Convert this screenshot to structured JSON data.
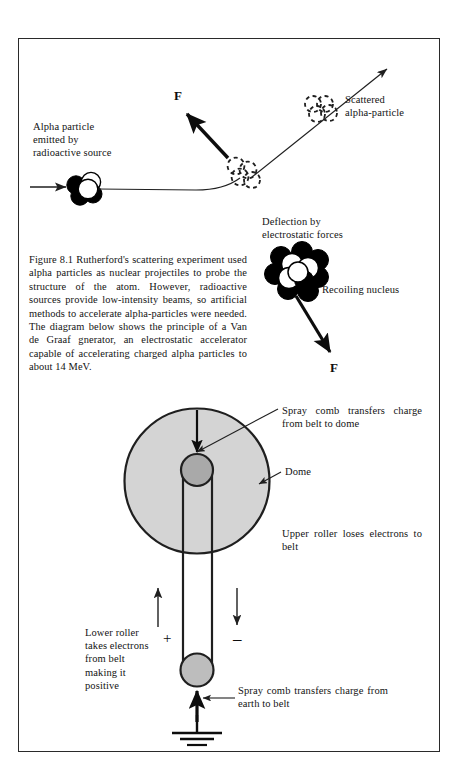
{
  "figure": {
    "caption": "Figure 8.1 Rutherford's scattering experiment used alpha particles as nuclear projectiles to probe the structure of the atom. However, radioactive sources provide low-intensity beams, so artificial methods to accelerate alpha-particles were needed. The diagram below shows the principle of a Van de Graaf gnerator, an electrostatic accelerator capable of accelerating charged alpha particles to about 14 MeV.",
    "labels": {
      "alpha_particle": "Alpha particle\nemitted by\nradioactive source",
      "scattered": "Scattered\nalpha-particle",
      "deflection": "Deflection by\nelectrostatic forces",
      "recoiling_nucleus": "Recoiling nucleus",
      "force_top": "F",
      "force_bottom": "F",
      "spray_comb_top": "Spray comb transfers charge from belt to dome",
      "dome": "Dome",
      "upper_roller": "Upper roller loses electrons to belt",
      "lower_roller": "Lower roller\ntakes electrons\nfrom belt\nmaking it\npositive",
      "spray_comb_bottom": "Spray comb transfers charge from earth to belt",
      "plus_sign": "+",
      "minus_sign": "–"
    },
    "colors": {
      "stroke": "#1f1f1f",
      "dome_fill": "#d4d4d4",
      "roller_fill": "#a9a9a9",
      "nucleon_dark": "#000000",
      "nucleon_light": "#ffffff",
      "frame": "#2a2a2a",
      "page_background": "#ffffff"
    }
  }
}
